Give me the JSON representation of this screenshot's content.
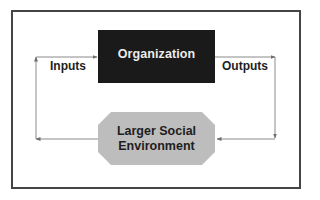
{
  "diagram": {
    "nodes": {
      "organization": {
        "label": "Organization",
        "fill": "#1a1a1a",
        "text_color": "#ececec",
        "shape": "rectangle"
      },
      "environment": {
        "label_line1": "Larger Social",
        "label_line2": "Environment",
        "fill": "#bdbdbd",
        "text_color": "#1e1e1e",
        "shape": "octagon"
      }
    },
    "edge_labels": {
      "inputs": "Inputs",
      "outputs": "Outputs"
    },
    "edges": [
      {
        "from": "organization",
        "to": "environment",
        "label": "Outputs"
      },
      {
        "from": "environment",
        "to": "organization",
        "label": "Inputs"
      }
    ],
    "colors": {
      "frame": "#444444",
      "connector": "#8a8a8a",
      "background": "#ffffff"
    }
  }
}
